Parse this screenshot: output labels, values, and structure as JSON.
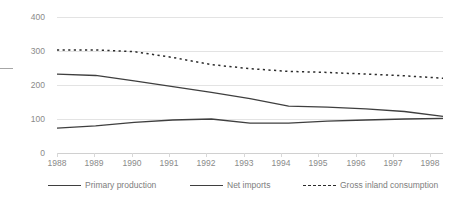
{
  "chart_data": {
    "type": "line",
    "title": "",
    "xlabel": "",
    "ylabel": "",
    "categories": [
      "1988",
      "1989",
      "1990",
      "1991",
      "1992",
      "1993",
      "1994",
      "1995",
      "1996",
      "1997",
      "1998"
    ],
    "x_tick_labels": [
      "1988",
      "1989",
      "1990",
      "1991",
      "1992",
      "1993",
      "1994",
      "1995",
      "1996",
      "1997",
      "1998"
    ],
    "y_tick_labels": [
      "0",
      "100",
      "200",
      "300",
      "400"
    ],
    "y_ticks": [
      0,
      100,
      200,
      300,
      400
    ],
    "ylim": [
      0,
      400
    ],
    "xlim": [
      "1988",
      "1998"
    ],
    "grid": true,
    "legend_position": "bottom",
    "series": [
      {
        "name": "Primary production",
        "style": "solid",
        "color": "#3f3f3f",
        "values": [
          232,
          228,
          212,
          195,
          178,
          160,
          138,
          135,
          130,
          122,
          108
        ]
      },
      {
        "name": "Net imports",
        "style": "solid",
        "color": "#3f3f3f",
        "values": [
          73,
          80,
          90,
          97,
          100,
          88,
          88,
          94,
          97,
          100,
          102
        ]
      },
      {
        "name": "Gross inland consumption",
        "style": "dotted",
        "color": "#2b2b2b",
        "values": [
          303,
          303,
          298,
          281,
          260,
          248,
          240,
          237,
          232,
          227,
          220
        ]
      }
    ]
  },
  "legend": {
    "items": [
      {
        "label": "Primary production",
        "marker": "solid-line"
      },
      {
        "label": "Net imports",
        "marker": "solid-line"
      },
      {
        "label": "Gross inland consumption",
        "marker": "dashed-line"
      }
    ]
  },
  "colors": {
    "background": "#ffffff",
    "gridline": "#e3e3e3",
    "axis": "#d0d0d0",
    "tick_text": "#8a8a8a",
    "legend_text": "#7d7d7d",
    "line_primary": "#3f3f3f",
    "line_dotted": "#2b2b2b",
    "crop_bracket": "#a6a6a6"
  }
}
